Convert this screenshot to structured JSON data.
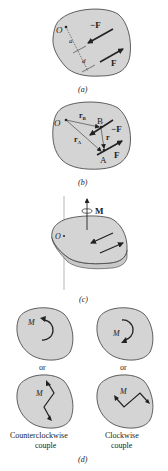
{
  "figure": {
    "colors": {
      "plate_fill": "#d4d4d4",
      "plate_edge": "#3a3a3a",
      "arrow": "#222222",
      "background": "#ffffff"
    },
    "panels": {
      "a": {
        "caption": "(a)",
        "point_label": "O",
        "labels": {
          "neg_force": "−F",
          "force": "F",
          "dist_a": "a",
          "dist_d": "d"
        }
      },
      "b": {
        "caption": "(b)",
        "point_label": "O",
        "labels": {
          "rB": "r",
          "rB_sub": "B",
          "rA": "r",
          "rA_sub": "A",
          "r": "r",
          "B": "B",
          "A": "A",
          "neg_force": "−F",
          "force": "F"
        }
      },
      "c": {
        "caption": "(c)",
        "point_label": "O",
        "moment_label": "M"
      },
      "d": {
        "caption": "(d)",
        "ccw_moment_label": "M",
        "cw_moment_label": "M",
        "or_left": "or",
        "or_right": "or",
        "ccw_zigzag_label": "M",
        "cw_zigzag_label": "M",
        "ccw_caption_line1": "Counterclockwise",
        "ccw_caption_line2": "couple",
        "cw_caption_line1": "Clockwise",
        "cw_caption_line2": "couple"
      }
    }
  }
}
